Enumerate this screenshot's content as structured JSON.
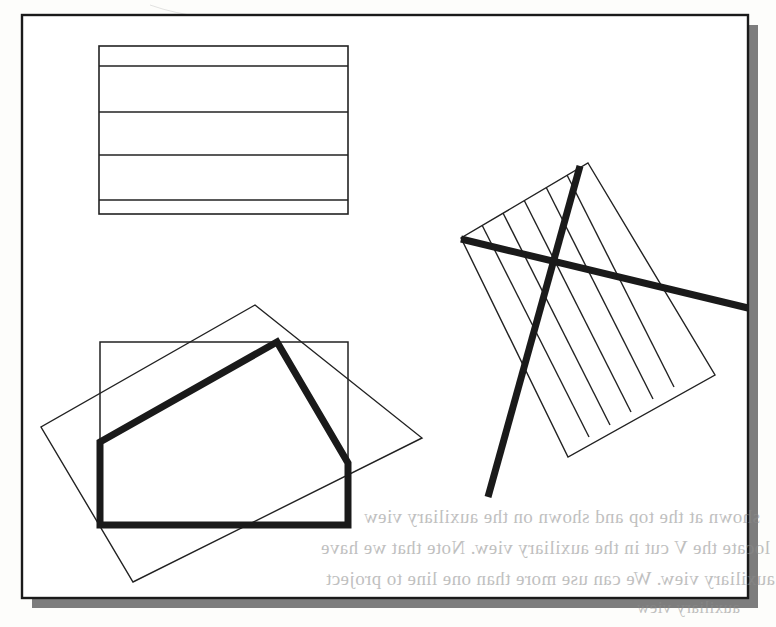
{
  "figure": {
    "kind": "engineering-drawing-scan",
    "caption_visible": false,
    "paper_color": "#fdfdfb",
    "ink_color": "#1a1a1a",
    "thin_stroke_color": "#222222",
    "thick_stroke_color": "#1a1a1a",
    "shadow_color": "#7d7d7d",
    "thin_stroke_width": 1.4,
    "thick_stroke_width": 7,
    "frame": {
      "name": "outer-drawing-border",
      "x": 22,
      "y": 15,
      "width": 726,
      "height": 583,
      "stroke_width": 2.4,
      "shadow_offset_x": 10,
      "shadow_offset_y": 10
    },
    "shapes": [
      {
        "name": "banded-rectangle",
        "type": "rect-with-horizontal-bands",
        "x": 99,
        "y": 46,
        "width": 249,
        "height": 168,
        "band_lines_y": [
          66,
          112,
          155,
          200
        ],
        "band_count": 5
      },
      {
        "name": "axis-aligned-rectangle",
        "type": "rect",
        "x": 100,
        "y": 342,
        "width": 248,
        "height": 183
      },
      {
        "name": "rotated-rectangle-outline",
        "type": "polygon",
        "points": "255,305 422,438 133,582 41,427",
        "rotation_deg": 28
      },
      {
        "name": "thick-pentagon-outline",
        "type": "polyline-thick",
        "points": "100,525 100,442 277,342 348,463 348,525 100,525"
      },
      {
        "name": "hatched-rotated-rectangle",
        "type": "polygon-with-parallel-hatch",
        "points": "588,163 715,375 568,457 461,238",
        "hatch_line_count": 5,
        "band_count": 6
      },
      {
        "name": "thick-diagonal-line-descending",
        "type": "line-thick",
        "x1": 461,
        "y1": 239,
        "x2": 748,
        "y2": 308
      },
      {
        "name": "thick-diagonal-line-crossing",
        "type": "line-thick",
        "x1": 580,
        "y1": 166,
        "x2": 488,
        "y2": 497
      }
    ]
  },
  "bleed_through": {
    "description": "faint mirrored text showing through from the reverse side of the scanned page",
    "lines": [
      {
        "text": "shown at the top and shown on the auxiliary view",
        "x": 22,
        "y": 516,
        "size": 19
      },
      {
        "text": "locate the V cut in the auxiliary view. Note that we have",
        "x": 22,
        "y": 547,
        "size": 19
      },
      {
        "text": "auxiliary view. We can use more than one line to project",
        "x": 22,
        "y": 578,
        "size": 19
      },
      {
        "text": "auxiliary view",
        "x": 600,
        "y": 606,
        "size": 17
      }
    ]
  }
}
